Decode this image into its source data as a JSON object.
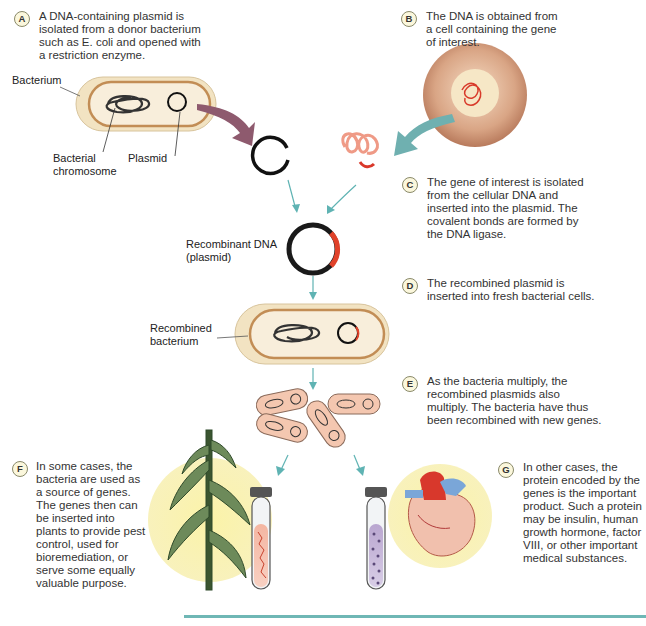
{
  "steps": [
    {
      "letter": "A",
      "text": "A DNA-containing plasmid is\nisolated from a donor bacterium\nsuch as E. coli and opened with\na restriction enzyme."
    },
    {
      "letter": "B",
      "text": "The DNA is obtained from\na cell containing the gene\nof interest."
    },
    {
      "letter": "C",
      "text": "The gene of interest is isolated\nfrom the cellular DNA and\ninserted into the plasmid. The\ncovalent bonds are formed by\nthe DNA ligase."
    },
    {
      "letter": "D",
      "text": "The recombined plasmid is\ninserted into fresh bacterial cells."
    },
    {
      "letter": "E",
      "text": "As the bacteria multiply, the\nrecombined plasmids also\nmultiply. The bacteria have thus\nbeen recombined with new genes."
    },
    {
      "letter": "F",
      "text": "In some cases, the\nbacteria are used as\na source of genes.\nThe genes then can\nbe inserted into\nplants to provide pest\ncontrol, used for\nbioremediation, or\nserve some equally\nvaluable purpose."
    },
    {
      "letter": "G",
      "text": "In other cases, the\nprotein encoded by the\ngenes is the important\nproduct. Such a protein\nmay be insulin, human\ngrowth hormone, factor\nVIII, or other important\nmedical substances."
    }
  ],
  "labels": {
    "bacterium": "Bacterium",
    "bacterial_chromosome": "Bacterial\nchromosome",
    "plasmid": "Plasmid",
    "recombinant_dna": "Recombinant DNA\n(plasmid)",
    "recombined_bacterium": "Recombined\nbacterium"
  },
  "colors": {
    "arrow_teal": "#5fb3b3",
    "arrow_mauve": "#8e5a6e",
    "dna_red": "#e0422a",
    "bacterium_fill": "#f3e6c8",
    "bacterium_border": "#c79a5a",
    "rule": "#6fb7b5"
  }
}
